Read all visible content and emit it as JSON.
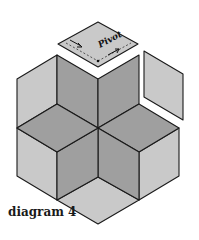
{
  "caption": "diagram 4",
  "pivot_label": "Pivot",
  "colors": {
    "light": "#c9c9c9",
    "dark": "#9f9f9f",
    "stroke": "#1a1a1a",
    "background": "#ffffff"
  },
  "pieces": {
    "floating_top": {
      "points": "98,22 138,44 98,67 58,44",
      "fill": "light"
    },
    "floating_right": {
      "points": "144,51 183,74 183,120 144,97",
      "fill": "light"
    },
    "outer_left_upper": {
      "points": "57,55 57,104 17,128 17,79",
      "fill": "light"
    },
    "outer_left_lower": {
      "points": "17,128 57,152 57,200 17,176",
      "fill": "light"
    },
    "outer_bottom": {
      "points": "98,177 139,200 98,224 57,200",
      "fill": "light"
    },
    "outer_right_lower": {
      "points": "179,128 179,176 139,200 139,152",
      "fill": "light"
    },
    "star_top_left": {
      "points": "57,55 98,79 98,128 57,104",
      "fill": "dark"
    },
    "star_top_right": {
      "points": "98,79 139,55 139,104 98,128",
      "fill": "dark"
    },
    "star_right": {
      "points": "98,128 139,104 179,128 139,152",
      "fill": "dark"
    },
    "star_bottom_right": {
      "points": "98,128 139,152 139,200 98,177",
      "fill": "dark"
    },
    "star_bottom_left": {
      "points": "98,128 98,177 57,200 57,152",
      "fill": "dark"
    },
    "star_left": {
      "points": "98,128 57,152 17,128 57,104",
      "fill": "dark"
    }
  }
}
